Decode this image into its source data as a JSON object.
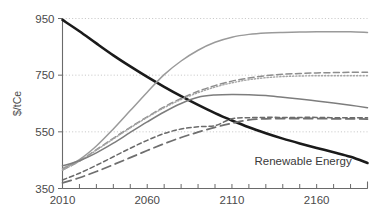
{
  "chart_data": {
    "type": "line",
    "title": "",
    "xlabel": "",
    "ylabel": "$/tCe",
    "xlim": [
      2010,
      2190
    ],
    "ylim": [
      350,
      950
    ],
    "grid": true,
    "grid_values": [
      550,
      750,
      950
    ],
    "legend_position": "none",
    "xticks": [
      2010,
      2020,
      2030,
      2040,
      2050,
      2060,
      2070,
      2080,
      2090,
      2100,
      2110,
      2120,
      2130,
      2140,
      2150,
      2160,
      2170,
      2180,
      2190
    ],
    "xtick_labels": [
      "2010",
      "2060",
      "2110",
      "2160"
    ],
    "xtick_label_values": [
      2010,
      2060,
      2110,
      2160
    ],
    "yticks": [
      350,
      550,
      750,
      950
    ],
    "ytick_labels": [
      "350",
      "550",
      "750",
      "950"
    ],
    "annotations": [
      {
        "text": "Renewable Energy",
        "x": 2152,
        "y": 432,
        "series": "renewable-energy"
      }
    ],
    "x": [
      2010,
      2020,
      2030,
      2040,
      2050,
      2060,
      2070,
      2080,
      2090,
      2100,
      2110,
      2120,
      2130,
      2140,
      2150,
      2160,
      2170,
      2180,
      2190
    ],
    "series": [
      {
        "name": "renewable-energy",
        "label": "Renewable Energy",
        "style": "solid",
        "color": "#1a1a1a",
        "width": 2.6,
        "values": [
          945,
          905,
          862,
          820,
          781,
          744,
          709,
          676,
          645,
          616,
          590,
          566,
          545,
          526,
          509,
          493,
          478,
          462,
          440
        ]
      },
      {
        "name": "upper-solid-grey",
        "label": "",
        "style": "solid",
        "color": "#9a9a9a",
        "width": 1.5,
        "values": [
          420,
          452,
          500,
          560,
          625,
          690,
          752,
          800,
          838,
          866,
          884,
          894,
          899,
          901,
          902,
          903,
          903,
          903,
          901
        ]
      },
      {
        "name": "upper-dashed-grey",
        "label": "",
        "style": "dashed",
        "color": "#8e8e8e",
        "width": 1.5,
        "values": [
          415,
          447,
          487,
          527,
          566,
          603,
          638,
          668,
          693,
          713,
          729,
          740,
          748,
          753,
          756,
          758,
          759,
          760,
          760
        ]
      },
      {
        "name": "upper-dotted-grey",
        "label": "",
        "style": "dotted",
        "color": "#a5a5a5",
        "width": 1.4,
        "values": [
          415,
          446,
          485,
          525,
          564,
          601,
          635,
          664,
          688,
          708,
          723,
          734,
          741,
          745,
          747,
          748,
          748,
          748,
          748
        ]
      },
      {
        "name": "mid-solid-grey",
        "label": "",
        "style": "solid",
        "color": "#7d7d7d",
        "width": 1.5,
        "values": [
          430,
          448,
          476,
          510,
          548,
          585,
          620,
          650,
          672,
          680,
          682,
          681,
          678,
          672,
          666,
          659,
          652,
          644,
          635
        ]
      },
      {
        "name": "lower-dashed-grey",
        "label": "",
        "style": "dashed-short",
        "color": "#6b6b6b",
        "width": 1.5,
        "values": [
          380,
          404,
          432,
          462,
          492,
          520,
          544,
          560,
          568,
          572,
          596,
          600,
          601,
          601,
          601,
          601,
          600,
          600,
          600
        ]
      },
      {
        "name": "lower-longdash-grey",
        "label": "",
        "style": "long-dash",
        "color": "#6f6f6f",
        "width": 1.8,
        "values": [
          370,
          388,
          410,
          434,
          459,
          484,
          508,
          530,
          549,
          566,
          580,
          592,
          596,
          597,
          597,
          597,
          596,
          596,
          595
        ]
      }
    ]
  },
  "axis": {
    "y_title": "$/tCe"
  }
}
